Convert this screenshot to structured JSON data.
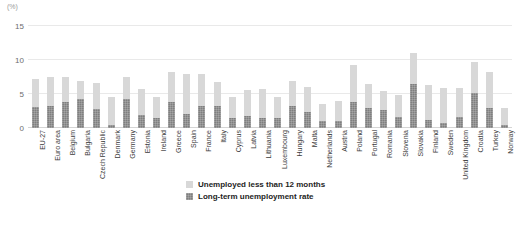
{
  "chart_data": {
    "type": "bar",
    "title": "",
    "subtitle": "",
    "unit_label": "(%)",
    "xlabel": "",
    "ylabel": "",
    "ylim": [
      0,
      15
    ],
    "yticks": [
      0,
      5,
      10,
      15
    ],
    "grid": true,
    "stacked": true,
    "legend_position": "bottom-center",
    "categories": [
      "EU-27",
      "Euro area",
      "Belgium",
      "Bulgaria",
      "Czech Republic",
      "Denmark",
      "Germany",
      "Estonia",
      "Ireland",
      "Greece",
      "Spain",
      "France",
      "Italy",
      "Cyprus",
      "Latvia",
      "Lithuania",
      "Luxembourg",
      "Hungary",
      "Malta",
      "Netherlands",
      "Austria",
      "Poland",
      "Portugal",
      "Romania",
      "Slovenia",
      "Slovakia",
      "Finland",
      "Sweden",
      "United Kingdom",
      "Croatia",
      "Turkey",
      "Norway"
    ],
    "series": [
      {
        "name": "Long-term unemployment rate",
        "color": "#7f7f7f",
        "values": [
          3.1,
          3.3,
          3.8,
          4.2,
          2.8,
          0.4,
          4.2,
          1.9,
          1.4,
          3.8,
          2.0,
          3.3,
          3.2,
          1.5,
          1.8,
          1.5,
          1.5,
          3.3,
          2.4,
          1.1,
          1.0,
          3.8,
          3.0,
          2.7,
          1.6,
          6.5,
          1.2,
          0.8,
          1.6,
          5.2,
          2.9,
          0.4
        ]
      },
      {
        "name": "Unemployed less than 12 months",
        "color": "#d8d8d8",
        "values": [
          4.1,
          4.2,
          3.7,
          2.7,
          3.8,
          4.1,
          3.3,
          3.8,
          3.2,
          4.4,
          5.9,
          4.6,
          3.5,
          3.1,
          3.8,
          4.2,
          3.1,
          3.6,
          3.7,
          2.5,
          2.9,
          5.4,
          3.5,
          2.7,
          3.2,
          4.5,
          5.1,
          5.1,
          4.3,
          4.5,
          5.3,
          2.6
        ]
      }
    ]
  },
  "legend": {
    "items": [
      {
        "label": "Unemployed less than 12 months",
        "swatch": "short"
      },
      {
        "label": "Long-term unemployment rate",
        "swatch": "long"
      }
    ]
  }
}
